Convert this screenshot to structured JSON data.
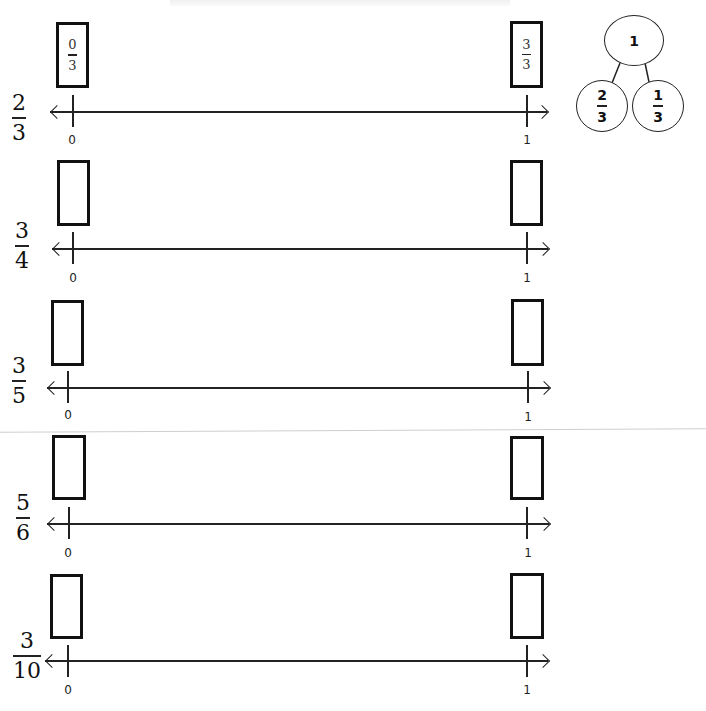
{
  "worksheet": {
    "number_lines": [
      {
        "label": {
          "numerator": "2",
          "denominator": "3"
        },
        "left_box": {
          "numerator": "0",
          "denominator": "3"
        },
        "right_box": {
          "numerator": "3",
          "denominator": "3"
        },
        "start_tick": "0",
        "end_tick": "1"
      },
      {
        "label": {
          "numerator": "3",
          "denominator": "4"
        },
        "left_box": {
          "numerator": "",
          "denominator": ""
        },
        "right_box": {
          "numerator": "",
          "denominator": ""
        },
        "start_tick": "0",
        "end_tick": "1"
      },
      {
        "label": {
          "numerator": "3",
          "denominator": "5"
        },
        "left_box": {
          "numerator": "",
          "denominator": ""
        },
        "right_box": {
          "numerator": "",
          "denominator": ""
        },
        "start_tick": "0",
        "end_tick": "1"
      },
      {
        "label": {
          "numerator": "5",
          "denominator": "6"
        },
        "left_box": {
          "numerator": "",
          "denominator": ""
        },
        "right_box": {
          "numerator": "",
          "denominator": ""
        },
        "start_tick": "0",
        "end_tick": "1"
      },
      {
        "label": {
          "numerator": "3",
          "denominator": "10"
        },
        "left_box": {
          "numerator": "",
          "denominator": ""
        },
        "right_box": {
          "numerator": "",
          "denominator": ""
        },
        "start_tick": "0",
        "end_tick": "1"
      }
    ],
    "number_bond": {
      "whole": "1",
      "part_left": {
        "numerator": "2",
        "denominator": "3"
      },
      "part_right": {
        "numerator": "1",
        "denominator": "3"
      }
    }
  }
}
